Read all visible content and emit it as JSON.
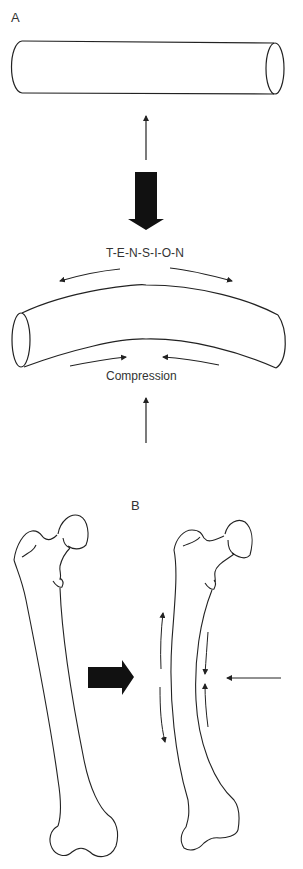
{
  "figure": {
    "panel_a": {
      "label": "A",
      "tension_label": "T-E-N-S-I-O-N",
      "compression_label": "Compression",
      "elements": [
        "straight-cylinder",
        "upward-force-arrow",
        "bold-down-arrow",
        "bent-cylinder",
        "tension-arrows",
        "compression-arrows",
        "upward-force-arrow-bottom"
      ]
    },
    "panel_b": {
      "label": "B",
      "elements": [
        "femur-normal",
        "bold-right-arrow",
        "femur-bowed",
        "tension-arrows-lateral",
        "compression-arrows-medial",
        "lateral-force-arrow"
      ]
    }
  },
  "colors": {
    "line": "#222222",
    "fill_arrow": "#111111",
    "background": "#ffffff"
  }
}
